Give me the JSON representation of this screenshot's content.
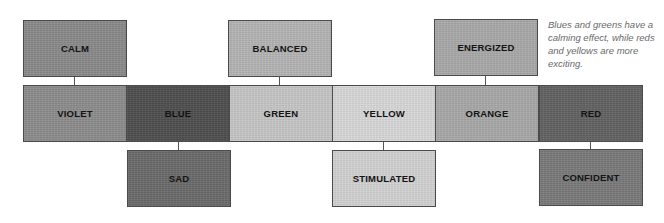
{
  "diagram": {
    "note": "Blues and greens have a calming effect, while reds and yellows are more exciting.",
    "colors": [
      {
        "label": "VIOLET",
        "fill": "#8c8c8c"
      },
      {
        "label": "BLUE",
        "fill": "#4e4e4e"
      },
      {
        "label": "GREEN",
        "fill": "#c6c6c6"
      },
      {
        "label": "YELLOW",
        "fill": "#d8d8d8"
      },
      {
        "label": "ORANGE",
        "fill": "#a8a8a8"
      },
      {
        "label": "RED",
        "fill": "#626262"
      }
    ],
    "moods_top": [
      {
        "label": "CALM",
        "linked_to": "VIOLET",
        "fill": "#8a8a8a"
      },
      {
        "label": "BALANCED",
        "linked_to": "GREEN",
        "fill": "#b4b4b4"
      },
      {
        "label": "ENERGIZED",
        "linked_to": "ORANGE",
        "fill": "#a9a9a9"
      }
    ],
    "moods_bottom": [
      {
        "label": "SAD",
        "linked_to": "BLUE",
        "fill": "#6a6a6a"
      },
      {
        "label": "STIMULATED",
        "linked_to": "YELLOW",
        "fill": "#d2d2d2"
      },
      {
        "label": "CONFIDENT",
        "linked_to": "RED",
        "fill": "#7a7a7a"
      }
    ]
  }
}
